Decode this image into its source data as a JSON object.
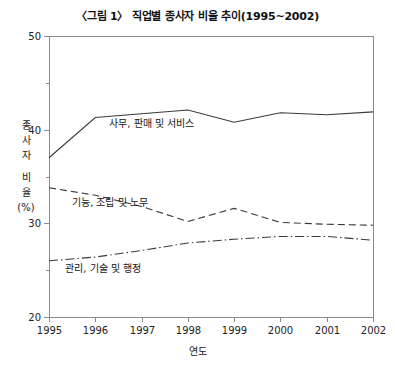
{
  "figure": {
    "title": "〈그림 1〉 직업별 종사자 비율 추이(1995~2002)",
    "xlabel": "연도",
    "ylabel_lines": [
      "종",
      "사",
      "자",
      "비",
      "율",
      "(%)"
    ],
    "background_color": "#ffffff",
    "axis_color": "#8a8a8a",
    "line_color": "#3a3a3a"
  },
  "chart_data": {
    "type": "line",
    "title": "〈그림 1〉 직업별 종사자 비율 추이(1995~2002)",
    "xlabel": "연도",
    "ylabel": "종사자 비율 (%)",
    "categories": [
      "1995",
      "1996",
      "1997",
      "1998",
      "1999",
      "2000",
      "2001",
      "2002"
    ],
    "x": [
      1995,
      1996,
      1997,
      1998,
      1999,
      2000,
      2001,
      2002
    ],
    "xlim": [
      1995,
      2002
    ],
    "ylim": [
      20,
      50
    ],
    "ytick_major": [
      20,
      30,
      40,
      50
    ],
    "ytick_minor": [
      25,
      35,
      45
    ],
    "ytick_labels": [
      "20",
      "30",
      "40",
      "50"
    ],
    "grid": false,
    "legend_position": "inline-annotation",
    "series": [
      {
        "name": "사무, 판매 및 서비스",
        "style": "solid",
        "values": [
          37.0,
          41.3,
          41.7,
          42.1,
          40.8,
          41.8,
          41.6,
          41.9
        ],
        "label_x": 1996.3,
        "label_y": 40.3
      },
      {
        "name": "기능, 조립 및 노무",
        "style": "dashed",
        "values": [
          33.8,
          33.0,
          31.8,
          30.2,
          31.6,
          30.1,
          29.9,
          29.8
        ],
        "label_x": 1995.5,
        "label_y": 31.9
      },
      {
        "name": "관리, 기술 및 행정",
        "style": "dashdot",
        "values": [
          26.0,
          26.4,
          27.1,
          27.9,
          28.3,
          28.6,
          28.6,
          28.2
        ],
        "label_x": 1995.35,
        "label_y": 24.8
      }
    ]
  },
  "geometry": {
    "plot_left": 49,
    "plot_right": 373,
    "plot_top": 36,
    "plot_bottom": 317
  }
}
